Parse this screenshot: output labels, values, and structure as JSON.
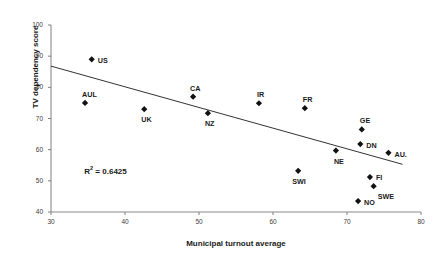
{
  "chart_data": {
    "type": "scatter",
    "title": "",
    "xlabel": "Municipal turnout average",
    "ylabel": "TV dependency score",
    "xlim": [
      30,
      80
    ],
    "ylim": [
      40,
      100
    ],
    "xticks": [
      30,
      40,
      50,
      60,
      70,
      80
    ],
    "yticks": [
      40,
      50,
      60,
      70,
      80,
      90,
      100
    ],
    "grid": false,
    "legend": "none",
    "annotations": [
      {
        "name": "r-squared",
        "text_html": "R<sup>2</sup> = 0.6425",
        "text": "R2 = 0.6425",
        "x": 34.5,
        "y": 53.5
      }
    ],
    "trendline": {
      "type": "linear",
      "x_start": 30,
      "y_start": 86.8,
      "x_end": 77.5,
      "y_end": 55.3,
      "r_squared": 0.6425
    },
    "points": [
      {
        "label": "US",
        "x": 35.5,
        "y": 89.0,
        "label_dx": 6,
        "label_dy": -3
      },
      {
        "label": "AUL",
        "x": 34.6,
        "y": 75.0,
        "label_dx": -3,
        "label_dy": -13
      },
      {
        "label": "UK",
        "x": 42.6,
        "y": 73.0,
        "label_dx": -3,
        "label_dy": 6
      },
      {
        "label": "CA",
        "x": 49.2,
        "y": 77.0,
        "label_dx": -3,
        "label_dy": -13
      },
      {
        "label": "NZ",
        "x": 51.2,
        "y": 71.7,
        "label_dx": -3,
        "label_dy": 6
      },
      {
        "label": "IR",
        "x": 58.1,
        "y": 74.9,
        "label_dx": -2,
        "label_dy": -13
      },
      {
        "label": "FR",
        "x": 64.3,
        "y": 73.3,
        "label_dx": -2,
        "label_dy": -13
      },
      {
        "label": "GE",
        "x": 72.0,
        "y": 66.5,
        "label_dx": -2,
        "label_dy": -13
      },
      {
        "label": "DN",
        "x": 71.8,
        "y": 61.8,
        "label_dx": 6,
        "label_dy": -3
      },
      {
        "label": "AU.",
        "x": 75.6,
        "y": 59.0,
        "label_dx": 6,
        "label_dy": -3
      },
      {
        "label": "NE",
        "x": 68.5,
        "y": 59.7,
        "label_dx": -2,
        "label_dy": 6
      },
      {
        "label": "SWI",
        "x": 63.4,
        "y": 53.2,
        "label_dx": -6,
        "label_dy": 6
      },
      {
        "label": "FI",
        "x": 73.1,
        "y": 51.2,
        "label_dx": 6,
        "label_dy": -4
      },
      {
        "label": "SWE",
        "x": 73.6,
        "y": 48.3,
        "label_dx": 4,
        "label_dy": 6
      },
      {
        "label": "NO",
        "x": 71.5,
        "y": 43.5,
        "label_dx": 6,
        "label_dy": -3
      }
    ],
    "style": {
      "marker_color": "#111111",
      "axis_color": "#808080",
      "trendline_color": "#333333",
      "text_color": "#1a1a1a",
      "background": "#ffffff"
    }
  }
}
